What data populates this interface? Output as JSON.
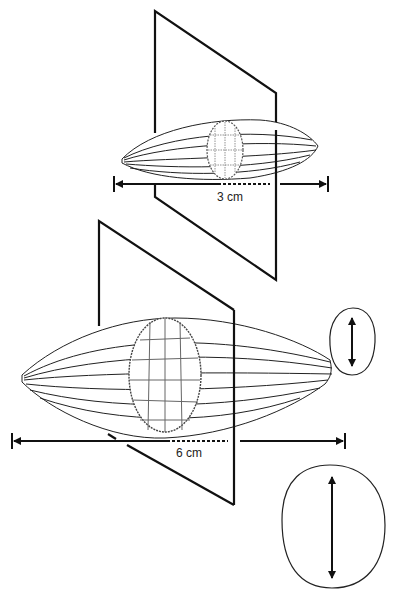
{
  "diagram": {
    "small_pod": {
      "length_label": "3 cm"
    },
    "large_pod": {
      "length_label": "6 cm"
    }
  }
}
